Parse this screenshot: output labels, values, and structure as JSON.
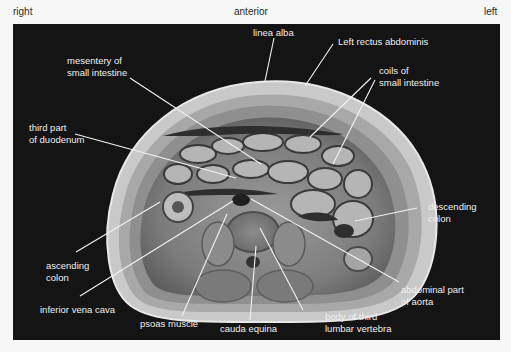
{
  "orientation": {
    "right": "right",
    "anterior": "anterior",
    "left": "left"
  },
  "labels": {
    "linea_alba": "linea alba",
    "left_rectus_abdominis": "Left rectus abdominis",
    "mesentery": "mesentery of\nsmall intestine",
    "coils": "coils of\nsmall intestine",
    "third_part_duodenum": "third part\nof duodenum",
    "descending_colon": "descending\ncolon",
    "ascending_colon": "ascending\ncolon",
    "abdominal_aorta": "abdominal part\nof aorta",
    "inferior_vena_cava": "inferior vena cava",
    "psoas_muscle": "psoas muscle",
    "cauda_equina": "cauda equina",
    "body_third_lumbar": "body of third\nlumbar vertebra"
  },
  "colors": {
    "panel_background": "#141414",
    "label_text": "#efefef",
    "leader_line": "#f2f2f2",
    "tissue_light": "#cfcfcf",
    "tissue_mid": "#8a8a8a",
    "tissue_dark": "#3a3a3a"
  }
}
